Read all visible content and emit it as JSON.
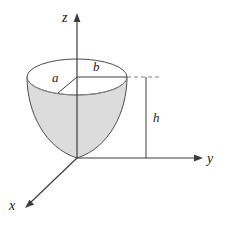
{
  "figure": {
    "background_color": "#ffffff",
    "stroke_color": "#4d4d4d",
    "axis_color": "#3d3d3d",
    "solid_fill_color": "#dcdcdc",
    "rim_fill_color": "#ffffff",
    "label_color": "#1a1a1a"
  },
  "axes": {
    "z": {
      "label": "z",
      "direction": "up",
      "arrow": true
    },
    "y": {
      "label": "y",
      "direction": "right",
      "arrow": true
    },
    "x": {
      "label": "x",
      "direction": "down-left",
      "arrow": true
    },
    "origin": {
      "x": 77,
      "y": 158
    }
  },
  "dimensions": {
    "a": {
      "label": "a",
      "description": "slant radius from axis to rim"
    },
    "b": {
      "label": "b",
      "description": "horizontal radius of top rim"
    },
    "h": {
      "label": "h",
      "description": "height of bowl from origin to rim"
    }
  },
  "guides": {
    "dashed_leader": {
      "style": "dashed",
      "from_rim": true
    },
    "height_line": {
      "style": "solid",
      "vertical": true
    }
  }
}
